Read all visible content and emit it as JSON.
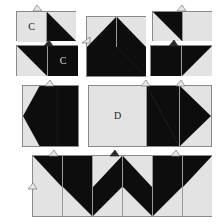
{
  "figure": {
    "background_color": "#ffffff",
    "fabric_light_color": "#e3e3e3",
    "fabric_dark_color": "#0d0d0d",
    "outline_color": "#8a8a8a",
    "seam_line_color": "#9a9a9a",
    "label_dark_color": "#1a1a1a",
    "label_light_color": "#dcdcdc"
  },
  "labels": {
    "c_on_light_square": "C",
    "c_on_dark_square": "C",
    "d_on_light_square": "D"
  },
  "units": [
    {
      "id": "unit-top-left",
      "name": "two-patch-c-left",
      "squares": [
        {
          "fill": "light",
          "triangle": "none",
          "label": "C"
        },
        {
          "fill": "light",
          "triangle": "lower-left",
          "label": ""
        }
      ],
      "tabs": 1
    },
    {
      "id": "unit-top-middle",
      "name": "four-patch-peak",
      "squares": [
        {
          "fill": "light",
          "triangle": "lower-right",
          "label": ""
        },
        {
          "fill": "light",
          "triangle": "lower-left",
          "label": ""
        },
        {
          "fill": "dark",
          "triangle": "none",
          "label": ""
        },
        {
          "fill": "dark",
          "triangle": "none",
          "label": ""
        }
      ],
      "tabs": 1
    },
    {
      "id": "unit-top-right",
      "name": "two-patch-plain-right",
      "squares": [
        {
          "fill": "light",
          "triangle": "upper-right",
          "label": ""
        },
        {
          "fill": "light",
          "triangle": "none",
          "label": ""
        }
      ],
      "tabs": 1
    },
    {
      "id": "unit-second-left",
      "name": "two-patch-c-dark",
      "squares": [
        {
          "fill": "light",
          "triangle": "upper-right",
          "label": ""
        },
        {
          "fill": "dark",
          "triangle": "none",
          "label": "C"
        }
      ],
      "tabs": 1
    },
    {
      "id": "unit-second-right",
      "name": "two-patch-dark-left",
      "squares": [
        {
          "fill": "dark",
          "triangle": "none",
          "label": ""
        },
        {
          "fill": "light",
          "triangle": "upper-left",
          "label": ""
        }
      ],
      "tabs": 1
    },
    {
      "id": "unit-mid-left",
      "name": "arrow-left-block",
      "squares": [
        {
          "fill": "light",
          "triangle": "arrow-left",
          "label": ""
        }
      ],
      "tabs": 1
    },
    {
      "id": "unit-mid-right",
      "name": "d-row-three-patch",
      "squares": [
        {
          "fill": "light",
          "triangle": "none",
          "label": "D"
        },
        {
          "fill": "dark",
          "triangle": "none",
          "label": ""
        },
        {
          "fill": "light",
          "triangle": "arrow-left",
          "label": ""
        }
      ],
      "tabs": 2
    },
    {
      "id": "unit-bottom-strip",
      "name": "assembled-bottom-row",
      "squares": [
        {
          "fill": "light",
          "triangle": "upper-right",
          "label": ""
        },
        {
          "fill": "light",
          "triangle": "lower-left",
          "label": ""
        },
        {
          "fill": "light",
          "triangle": "lower-right",
          "label": ""
        },
        {
          "fill": "light",
          "triangle": "lower-left",
          "label": ""
        },
        {
          "fill": "light",
          "triangle": "lower-right",
          "label": ""
        },
        {
          "fill": "light",
          "triangle": "upper-left",
          "label": ""
        },
        {
          "fill": "light",
          "triangle": "none",
          "label": ""
        },
        {
          "fill": "light",
          "triangle": "upper-right",
          "label": ""
        },
        {
          "fill": "light",
          "triangle": "upper-left",
          "label": ""
        },
        {
          "fill": "light",
          "triangle": "upper-right",
          "label": ""
        },
        {
          "fill": "light",
          "triangle": "upper-left",
          "label": ""
        },
        {
          "fill": "light",
          "triangle": "none",
          "label": ""
        }
      ],
      "tabs": 3
    }
  ]
}
